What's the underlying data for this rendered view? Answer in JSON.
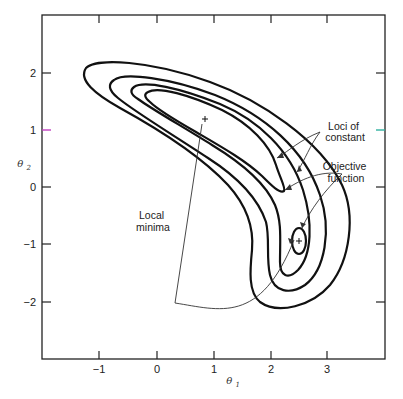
{
  "chart_data": {
    "type": "contour",
    "title": "",
    "xlabel": "θ1",
    "ylabel": "θ2",
    "xlim": [
      -2,
      4
    ],
    "ylim": [
      -3,
      3
    ],
    "grid": false,
    "x_ticks": [
      "-1",
      "0",
      "1",
      "2",
      "3"
    ],
    "y_ticks": [
      "2",
      "1",
      "0",
      "-1",
      "-2"
    ],
    "x_tick_values": [
      -1,
      0,
      1,
      2,
      3
    ],
    "y_tick_values": [
      2,
      1,
      0,
      -1,
      -2
    ],
    "local_minima": [
      {
        "theta1": 0.84,
        "theta2": 1.19,
        "marker": "+"
      },
      {
        "theta1": 2.49,
        "theta2": -0.95,
        "marker": "+"
      }
    ],
    "contour_levels": 5,
    "annotations": {
      "loci_line1": "Loci of",
      "loci_line2": "constant",
      "objective_line1": "Objective",
      "objective_line2": "function",
      "minima_line1": "Local",
      "minima_line2": "minima"
    },
    "tick_marks_at_theta2_1": {
      "left_color": "#c040c0",
      "right_color": "#30b0a0"
    }
  }
}
